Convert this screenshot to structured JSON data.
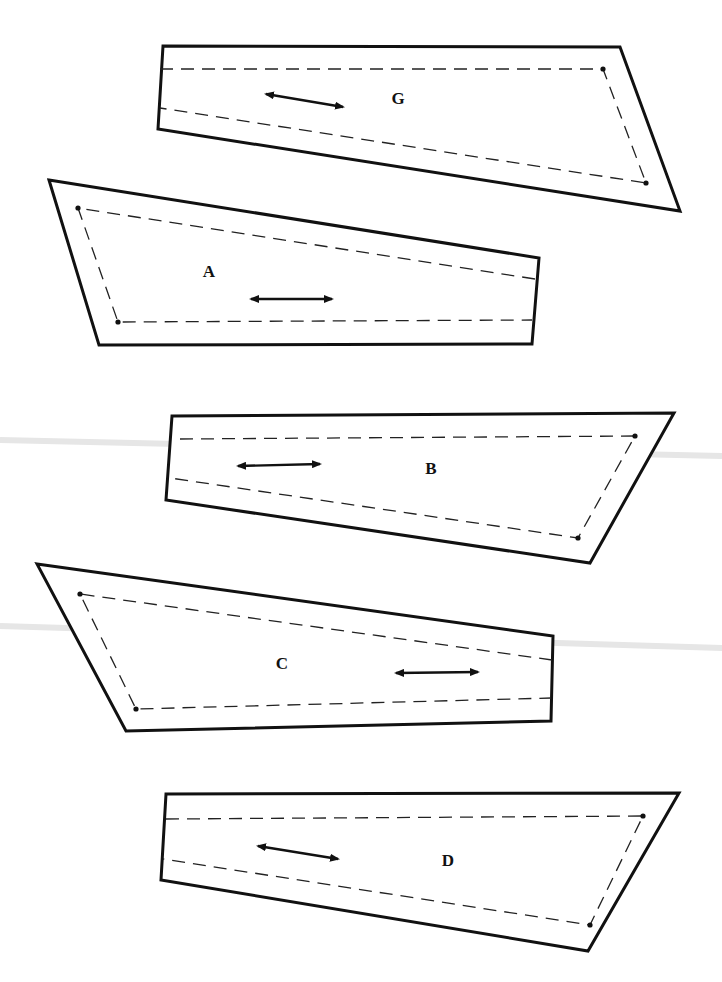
{
  "diagram": {
    "type": "sewing-pattern-pieces",
    "background": "#ffffff",
    "line_color": "#111111",
    "pieces": [
      {
        "label": "G",
        "outline": "163,46 620,47 680,211 158,129",
        "seam": "160,69 603,69 646,183 160,108",
        "dots": [
          [
            603,
            69
          ],
          [
            646,
            183
          ]
        ],
        "grainline": {
          "x1": 266,
          "y1": 94,
          "x2": 343,
          "y2": 107
        },
        "label_pos": [
          398,
          104
        ]
      },
      {
        "label": "A",
        "outline": "49,180 539,258 532,344 99,345",
        "seam": "535,279 78,208 118,322 532,320",
        "dots": [
          [
            78,
            208
          ],
          [
            118,
            322
          ]
        ],
        "grainline": {
          "x1": 251,
          "y1": 299,
          "x2": 332,
          "y2": 299
        },
        "label_pos": [
          209,
          277
        ]
      },
      {
        "label": "B",
        "outline": "172,416 674,413 590,563 166,500",
        "seam": "180,439 635,436 578,538 170,478",
        "dots": [
          [
            635,
            436
          ],
          [
            578,
            538
          ]
        ],
        "grainline": {
          "x1": 238,
          "y1": 466,
          "x2": 320,
          "y2": 464
        },
        "label_pos": [
          431,
          474
        ]
      },
      {
        "label": "C",
        "outline": "37,564 553,636 551,721 126,731",
        "seam": "552,660 80,594 136,709 551,698",
        "dots": [
          [
            80,
            594
          ],
          [
            136,
            709
          ]
        ],
        "grainline": {
          "x1": 396,
          "y1": 673,
          "x2": 478,
          "y2": 672
        },
        "label_pos": [
          282,
          669
        ]
      },
      {
        "label": "D",
        "outline": "166,794 679,793 588,951 161,880",
        "seam": "166,819 643,816 590,925 163,859",
        "dots": [
          [
            643,
            816
          ],
          [
            590,
            925
          ]
        ],
        "grainline": {
          "x1": 258,
          "y1": 846,
          "x2": 338,
          "y2": 859
        },
        "label_pos": [
          448,
          866
        ]
      }
    ]
  }
}
